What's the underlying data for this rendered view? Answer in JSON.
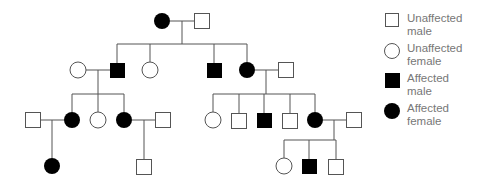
{
  "diagram": {
    "type": "pedigree",
    "colors": {
      "line": "#555555",
      "affected": "#000000",
      "unaffected": "#ffffff"
    },
    "generations": [
      {
        "id": "I",
        "members": [
          {
            "id": "I-1",
            "sex": "female",
            "affected": true
          },
          {
            "id": "I-2",
            "sex": "male",
            "affected": false
          }
        ]
      },
      {
        "id": "II",
        "members": [
          {
            "id": "II-spouse-1",
            "sex": "female",
            "affected": false
          },
          {
            "id": "II-1",
            "sex": "male",
            "affected": true
          },
          {
            "id": "II-2",
            "sex": "female",
            "affected": false
          },
          {
            "id": "II-3",
            "sex": "male",
            "affected": true
          },
          {
            "id": "II-4",
            "sex": "female",
            "affected": true
          },
          {
            "id": "II-spouse-2",
            "sex": "male",
            "affected": false
          }
        ]
      },
      {
        "id": "III",
        "members": [
          {
            "id": "III-spouse-1",
            "sex": "male",
            "affected": false
          },
          {
            "id": "III-1",
            "sex": "female",
            "affected": true
          },
          {
            "id": "III-2",
            "sex": "female",
            "affected": false
          },
          {
            "id": "III-3",
            "sex": "female",
            "affected": true
          },
          {
            "id": "III-spouse-2",
            "sex": "male",
            "affected": false
          },
          {
            "id": "III-4",
            "sex": "female",
            "affected": false
          },
          {
            "id": "III-5",
            "sex": "male",
            "affected": false
          },
          {
            "id": "III-6",
            "sex": "male",
            "affected": true
          },
          {
            "id": "III-7",
            "sex": "male",
            "affected": false
          },
          {
            "id": "III-8",
            "sex": "female",
            "affected": true
          },
          {
            "id": "III-spouse-3",
            "sex": "male",
            "affected": false
          }
        ]
      },
      {
        "id": "IV",
        "members": [
          {
            "id": "IV-1",
            "sex": "female",
            "affected": true
          },
          {
            "id": "IV-2",
            "sex": "male",
            "affected": false
          },
          {
            "id": "IV-3",
            "sex": "female",
            "affected": false
          },
          {
            "id": "IV-4",
            "sex": "male",
            "affected": true
          },
          {
            "id": "IV-5",
            "sex": "male",
            "affected": false
          }
        ]
      }
    ]
  },
  "legend": {
    "items": [
      {
        "symbol": "square-open",
        "line1": "Unaffected",
        "line2": "male"
      },
      {
        "symbol": "circle-open",
        "line1": "Unaffected",
        "line2": "female"
      },
      {
        "symbol": "square-filled",
        "line1": "Affected",
        "line2": "male"
      },
      {
        "symbol": "circle-filled",
        "line1": "Affected",
        "line2": "female"
      }
    ]
  }
}
